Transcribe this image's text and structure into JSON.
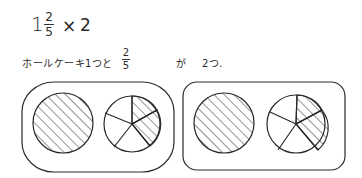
{
  "equation": {
    "whole": "1",
    "numerator": "2",
    "denominator": "5",
    "operator": "×",
    "multiplier": "2"
  },
  "sentence": {
    "prefix": "ホールケーキ1つと",
    "frac_numerator": "2",
    "frac_denominator": "5",
    "suffix_particle": "が",
    "suffix_count": "2つ."
  },
  "groups": [
    {
      "whole_cake": "shaded",
      "partial_cake": {
        "slices": 5,
        "shaded": 2
      }
    },
    {
      "whole_cake": "shaded",
      "partial_cake": {
        "slices": 5,
        "shaded": 2
      }
    }
  ],
  "colors": {
    "ink": "#2a2a2a",
    "background": "#ffffff"
  }
}
